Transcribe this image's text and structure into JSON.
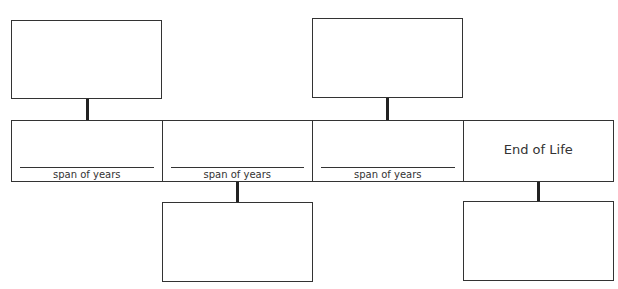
{
  "diagram": {
    "type": "timeline-graphic-organizer",
    "top_boxes": [
      {
        "id": "top-1",
        "text": ""
      },
      {
        "id": "top-2",
        "text": ""
      }
    ],
    "timeline_cells": [
      {
        "id": "cell-1",
        "label": "span of years",
        "value": ""
      },
      {
        "id": "cell-2",
        "label": "span of years",
        "value": ""
      },
      {
        "id": "cell-3",
        "label": "span of years",
        "value": ""
      },
      {
        "id": "cell-4",
        "title": "End of Life"
      }
    ],
    "bottom_boxes": [
      {
        "id": "bottom-1",
        "text": ""
      },
      {
        "id": "bottom-2",
        "text": ""
      }
    ]
  }
}
